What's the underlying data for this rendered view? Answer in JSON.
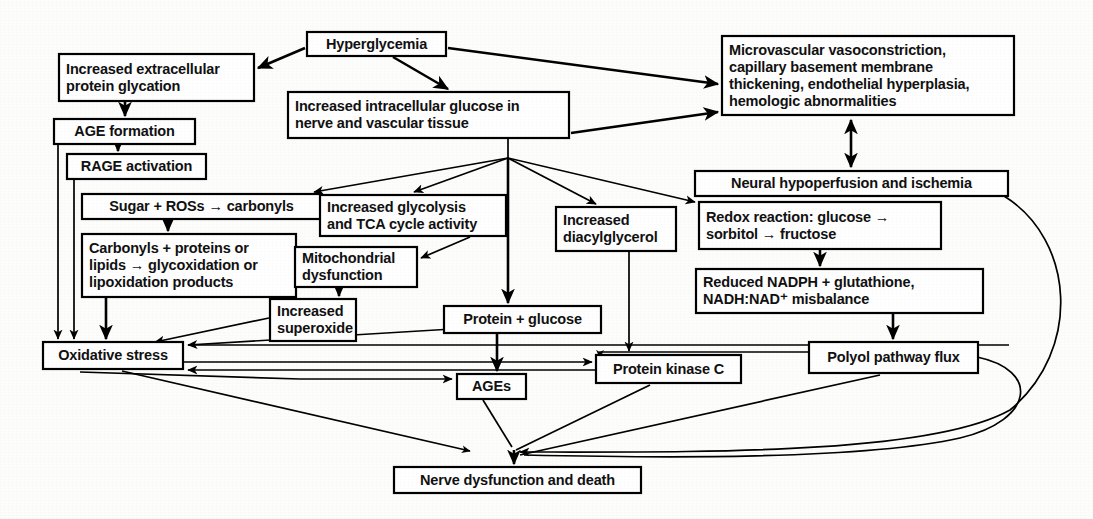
{
  "diagram": {
    "background_color": "#fdfdfc",
    "line_color": "#000000",
    "box_fill": "#ffffff",
    "nodes": [
      {
        "id": "hyperglycemia",
        "lines": [
          "Hyperglycemia"
        ],
        "x": 307,
        "y": 32,
        "w": 139,
        "h": 24
      },
      {
        "id": "extracellular",
        "lines": [
          "Increased extracellular",
          "protein glycation"
        ],
        "x": 59,
        "y": 54,
        "w": 195,
        "h": 47
      },
      {
        "id": "intracellular",
        "lines": [
          "Increased intracellular glucose in",
          "nerve and vascular tissue"
        ],
        "x": 288,
        "y": 92,
        "w": 281,
        "h": 46
      },
      {
        "id": "microvascular",
        "lines": [
          "Microvascular vasoconstriction,",
          "capillary basement membrane",
          "thickening, endothelial hyperplasia,",
          "hemologic abnormalities"
        ],
        "x": 722,
        "y": 36,
        "w": 292,
        "h": 79
      },
      {
        "id": "age_formation",
        "lines": [
          "AGE formation"
        ],
        "x": 54,
        "y": 119,
        "w": 141,
        "h": 25
      },
      {
        "id": "rage_activation",
        "lines": [
          "RAGE activation"
        ],
        "x": 67,
        "y": 154,
        "w": 139,
        "h": 25
      },
      {
        "id": "neural_hypo",
        "lines": [
          "Neural hypoperfusion and ischemia"
        ],
        "x": 695,
        "y": 171,
        "w": 313,
        "h": 25
      },
      {
        "id": "sugar_ros",
        "lines": [
          "Sugar + ROSs → carbonyls"
        ],
        "x": 82,
        "y": 194,
        "w": 239,
        "h": 25
      },
      {
        "id": "glycolysis",
        "lines": [
          "Increased glycolysis",
          "and TCA cycle activity"
        ],
        "x": 320,
        "y": 195,
        "w": 186,
        "h": 41
      },
      {
        "id": "diacylglycerol",
        "lines": [
          "Increased",
          "diacylglycerol"
        ],
        "x": 556,
        "y": 207,
        "w": 120,
        "h": 44
      },
      {
        "id": "redox",
        "lines": [
          "Redox reaction: glucose →",
          "sorbitol → fructose"
        ],
        "x": 699,
        "y": 202,
        "w": 242,
        "h": 47
      },
      {
        "id": "carbonyls",
        "lines": [
          "Carbonyls + proteins or",
          "lipids → glycoxidation or",
          "lipoxidation products"
        ],
        "x": 82,
        "y": 234,
        "w": 214,
        "h": 63
      },
      {
        "id": "mitochondrial",
        "lines": [
          "Mitochondrial",
          "dysfunction"
        ],
        "x": 295,
        "y": 247,
        "w": 122,
        "h": 40
      },
      {
        "id": "nadph",
        "lines": [
          "Reduced NADPH + glutathione,",
          "NADH:NAD⁺ misbalance"
        ],
        "x": 696,
        "y": 269,
        "w": 287,
        "h": 44
      },
      {
        "id": "superoxide",
        "lines": [
          "Increased",
          "superoxide"
        ],
        "x": 270,
        "y": 299,
        "w": 86,
        "h": 42
      },
      {
        "id": "protein_glucose",
        "lines": [
          "Protein + glucose"
        ],
        "x": 444,
        "y": 306,
        "w": 157,
        "h": 27
      },
      {
        "id": "oxidative",
        "lines": [
          "Oxidative stress"
        ],
        "x": 43,
        "y": 342,
        "w": 140,
        "h": 27
      },
      {
        "id": "polyol",
        "lines": [
          "Polyol pathway flux"
        ],
        "x": 809,
        "y": 342,
        "w": 169,
        "h": 31
      },
      {
        "id": "pkc",
        "lines": [
          "Protein kinase C"
        ],
        "x": 596,
        "y": 355,
        "w": 145,
        "h": 28
      },
      {
        "id": "ages",
        "lines": [
          "AGEs"
        ],
        "x": 457,
        "y": 374,
        "w": 69,
        "h": 25
      },
      {
        "id": "nerve_death",
        "lines": [
          "Nerve dysfunction and death"
        ],
        "x": 394,
        "y": 467,
        "w": 247,
        "h": 26
      }
    ],
    "edge_list": [
      {
        "from": "hyperglycemia",
        "to": "extracellular",
        "label": "hyperglycemia-to-extracellular-glycation"
      },
      {
        "from": "hyperglycemia",
        "to": "intracellular",
        "label": "hyperglycemia-to-intracellular-glucose"
      },
      {
        "from": "hyperglycemia",
        "to": "microvascular",
        "label": "hyperglycemia-to-microvascular"
      },
      {
        "from": "intracellular",
        "to": "microvascular",
        "label": "intracellular-glucose-to-microvascular"
      },
      {
        "from": "extracellular",
        "to": "age_formation",
        "label": "extracellular-to-age-formation"
      },
      {
        "from": "age_formation",
        "to": "rage_activation",
        "label": "age-formation-to-rage-activation"
      },
      {
        "from": "age_formation",
        "to": "oxidative",
        "label": "age-formation-to-oxidative-stress"
      },
      {
        "from": "rage_activation",
        "to": "oxidative",
        "label": "rage-activation-to-oxidative-stress"
      },
      {
        "from": "intracellular",
        "to": "sugar_ros",
        "label": "hub-to-sugar-ros"
      },
      {
        "from": "intracellular",
        "to": "glycolysis",
        "label": "hub-to-glycolysis"
      },
      {
        "from": "intracellular",
        "to": "diacylglycerol",
        "label": "hub-to-diacylglycerol"
      },
      {
        "from": "intracellular",
        "to": "redox",
        "label": "hub-to-redox-reaction"
      },
      {
        "from": "intracellular",
        "to": "protein_glucose",
        "label": "hub-to-protein-glucose"
      },
      {
        "from": "sugar_ros",
        "to": "carbonyls",
        "label": "sugar-ros-to-carbonyls"
      },
      {
        "from": "carbonyls",
        "to": "oxidative",
        "label": "carbonyls-to-oxidative-stress"
      },
      {
        "from": "glycolysis",
        "to": "mitochondrial",
        "label": "glycolysis-to-mitochondrial-dysfunction"
      },
      {
        "from": "mitochondrial",
        "to": "superoxide",
        "label": "mitochondrial-to-superoxide"
      },
      {
        "from": "superoxide",
        "to": "oxidative",
        "label": "superoxide-to-oxidative-stress"
      },
      {
        "from": "protein_glucose",
        "to": "oxidative",
        "label": "protein-glucose-to-oxidative-stress"
      },
      {
        "from": "protein_glucose",
        "to": "ages",
        "label": "protein-glucose-to-ages"
      },
      {
        "from": "microvascular",
        "to": "neural_hypo",
        "label": "microvascular-neural-hypoperfusion-bidirectional"
      },
      {
        "from": "neural_hypo",
        "to": "oxidative",
        "label": "neural-hypoperfusion-to-oxidative-stress"
      },
      {
        "from": "redox",
        "to": "nadph",
        "label": "redox-to-nadph"
      },
      {
        "from": "nadph",
        "to": "polyol",
        "label": "nadph-to-polyol-pathway-flux"
      },
      {
        "from": "polyol",
        "to": "pkc",
        "label": "polyol-to-protein-kinase-c"
      },
      {
        "from": "diacylglycerol",
        "to": "pkc",
        "label": "diacylglycerol-to-protein-kinase-c"
      },
      {
        "from": "oxidative",
        "to": "pkc",
        "label": "oxidative-stress-to-protein-kinase-c"
      },
      {
        "from": "oxidative",
        "to": "ages",
        "label": "oxidative-stress-to-ages"
      },
      {
        "from": "oxidative",
        "to": "nerve_death",
        "label": "oxidative-stress-to-nerve-death"
      },
      {
        "from": "ages",
        "to": "nerve_death",
        "label": "ages-to-nerve-death"
      },
      {
        "from": "pkc",
        "to": "nerve_death",
        "label": "protein-kinase-c-to-nerve-death"
      },
      {
        "from": "polyol",
        "to": "nerve_death",
        "label": "polyol-to-nerve-death"
      },
      {
        "from": "neural_hypo",
        "to": "nerve_death",
        "label": "neural-hypoperfusion-to-nerve-death"
      }
    ]
  }
}
